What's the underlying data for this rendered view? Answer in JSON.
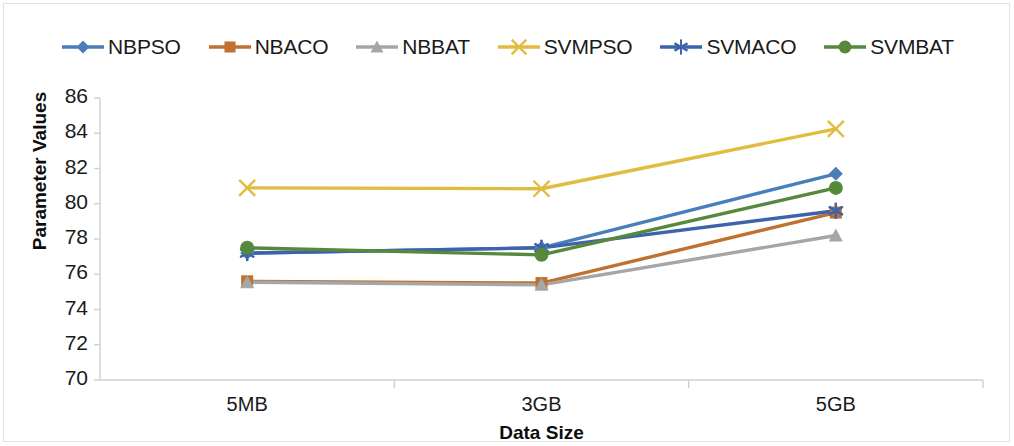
{
  "chart_data": {
    "type": "line",
    "title": "",
    "xlabel": "Data Size",
    "ylabel": "Parameter Values",
    "categories": [
      "5MB",
      "3GB",
      "5GB"
    ],
    "ylim": [
      70,
      86
    ],
    "yticks": [
      70,
      72,
      74,
      76,
      78,
      80,
      82,
      84,
      86
    ],
    "grid": false,
    "legend_position": "top",
    "series": [
      {
        "name": "NBPSO",
        "values": [
          77.2,
          77.5,
          81.7
        ],
        "color": "#4a7ebb",
        "marker": "diamond"
      },
      {
        "name": "NBACO",
        "values": [
          75.6,
          75.5,
          79.5
        ],
        "color": "#bf7130",
        "marker": "square"
      },
      {
        "name": "NBBAT",
        "values": [
          75.55,
          75.4,
          78.2
        ],
        "color": "#a6a6a6",
        "marker": "triangle"
      },
      {
        "name": "SVMPSO",
        "values": [
          80.9,
          80.85,
          84.25
        ],
        "color": "#e0bc3f",
        "marker": "x"
      },
      {
        "name": "SVMACO",
        "values": [
          77.2,
          77.5,
          79.6
        ],
        "color": "#3d64ab",
        "marker": "asterisk"
      },
      {
        "name": "SVMBAT",
        "values": [
          77.5,
          77.1,
          80.9
        ],
        "color": "#56893c",
        "marker": "circle"
      }
    ]
  },
  "axis": {
    "y_title": "Parameter Values",
    "x_title": "Data Size",
    "y_tick_labels": [
      "86",
      "84",
      "82",
      "80",
      "78",
      "76",
      "74",
      "72",
      "70"
    ],
    "x_tick_labels": [
      "5MB",
      "3GB",
      "5GB"
    ]
  },
  "legend": {
    "items": [
      {
        "label": "NBPSO",
        "icon": "diamond-marker-icon"
      },
      {
        "label": "NBACO",
        "icon": "square-marker-icon"
      },
      {
        "label": "NBBAT",
        "icon": "triangle-marker-icon"
      },
      {
        "label": "SVMPSO",
        "icon": "x-marker-icon"
      },
      {
        "label": "SVMACO",
        "icon": "asterisk-marker-icon"
      },
      {
        "label": "SVMBAT",
        "icon": "circle-marker-icon"
      }
    ]
  }
}
